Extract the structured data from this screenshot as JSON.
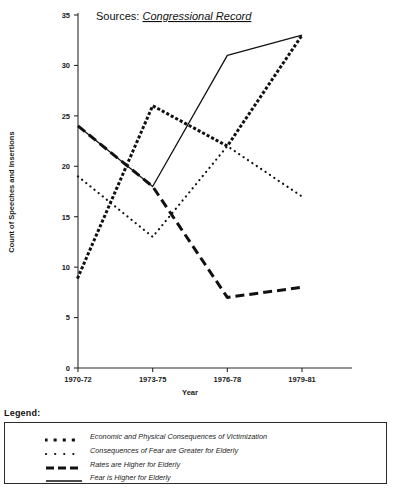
{
  "annotation": {
    "prefix": "Sources:",
    "source_name": "Congressional Record"
  },
  "legend": {
    "title": "Legend:",
    "items": [
      {
        "label": "Economic and Physical Consequences of Victimization",
        "style": "square-dotted"
      },
      {
        "label": "Consequences of Fear are Greater for Elderly",
        "style": "fine-dotted"
      },
      {
        "label": "Rates are Higher for Elderly",
        "style": "dashed"
      },
      {
        "label": "Fear is Higher for Elderly",
        "style": "solid"
      }
    ]
  },
  "chart_data": {
    "type": "line",
    "title": "",
    "xlabel": "Year",
    "ylabel": "Count of Speeches and Insertions",
    "categories": [
      "1970-72",
      "1973-75",
      "1976-78",
      "1979-81"
    ],
    "ylim": [
      0,
      35
    ],
    "yticks": [
      0,
      5,
      10,
      15,
      20,
      25,
      30,
      35
    ],
    "grid": false,
    "legend_position": "below-plot",
    "annotations": [
      "Sources: Congressional Record"
    ],
    "series": [
      {
        "name": "Economic and Physical Consequences of Victimization",
        "style": "square-dotted",
        "values": [
          9,
          26,
          22,
          33
        ]
      },
      {
        "name": "Consequences of Fear are Greater for Elderly",
        "style": "fine-dotted",
        "values": [
          19,
          13,
          22,
          17
        ]
      },
      {
        "name": "Rates are Higher for Elderly",
        "style": "dashed",
        "values": [
          24,
          18,
          7,
          8
        ]
      },
      {
        "name": "Fear is Higher for Elderly",
        "style": "solid",
        "values": [
          24,
          18,
          31,
          33
        ]
      }
    ]
  }
}
